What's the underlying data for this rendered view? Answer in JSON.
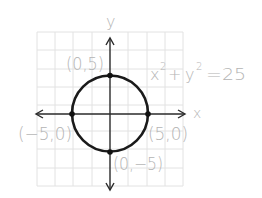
{
  "figure": {
    "equation": {
      "x_term": "x",
      "x_exp": "2",
      "plus": "+",
      "y_term": "y",
      "y_exp": "2",
      "rhs": "=25"
    },
    "axes": {
      "x_label": "x",
      "y_label": "y"
    },
    "points": [
      {
        "label": "(0,5)",
        "x": 0,
        "y": 5
      },
      {
        "label": "(5,0)",
        "x": 5,
        "y": 0
      },
      {
        "label": "(0,−5)",
        "x": 0,
        "y": -5
      },
      {
        "label": "(−5,0)",
        "x": -5,
        "y": 0
      }
    ],
    "radius": 5,
    "center": [
      0,
      0
    ],
    "colors": {
      "grid": "#e2e2e2",
      "curve": "#1a1a1a",
      "axis": "#2a2a2a",
      "label": "#b4b4b4"
    }
  }
}
